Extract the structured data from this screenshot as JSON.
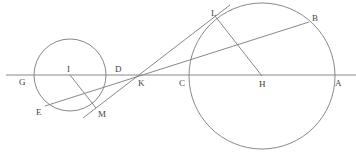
{
  "diagram": {
    "type": "geometry",
    "labels": {
      "G": "G",
      "I": "I",
      "D": "D",
      "K": "K",
      "C": "C",
      "H": "H",
      "A": "A",
      "L": "L",
      "B": "B",
      "E": "E",
      "M": "M"
    },
    "points": {
      "I": [
        70,
        75
      ],
      "H": [
        262,
        76
      ],
      "K": [
        139,
        75
      ],
      "L": [
        215,
        16
      ],
      "M": [
        96,
        108
      ],
      "B": [
        309,
        22
      ],
      "E": [
        45,
        106
      ],
      "G": [
        30,
        75
      ],
      "D": [
        113,
        75
      ],
      "C": [
        189,
        75
      ],
      "A": [
        334,
        75
      ]
    },
    "circles": [
      {
        "name": "small-circle",
        "center": "I",
        "radius": 36
      },
      {
        "name": "large-circle",
        "center": "H",
        "radius": 73
      }
    ],
    "segments": [
      {
        "name": "baseline",
        "from": [
          6,
          75
        ],
        "to": [
          356,
          75
        ]
      },
      {
        "name": "tangent-line",
        "from": [
          83,
          118
        ],
        "to": [
          230,
          5
        ]
      },
      {
        "name": "secant-line",
        "from": [
          45,
          106
        ],
        "to": [
          309,
          22
        ]
      },
      {
        "name": "radius-IM",
        "from": "I",
        "to": "M"
      },
      {
        "name": "radius-HL",
        "from": "H",
        "to": "L"
      }
    ],
    "colors": {
      "stroke": "#7a7a7a",
      "label": "#444444",
      "background": "#ffffff"
    }
  }
}
